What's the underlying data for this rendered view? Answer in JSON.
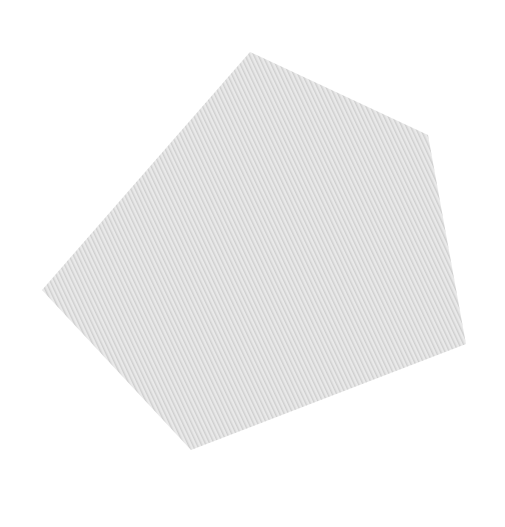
{
  "canvas": {
    "width": 505,
    "height": 527,
    "background": "#ffffff"
  },
  "shape": {
    "type": "pentagon",
    "fill": "#dddddd",
    "texture_light": "#e9e9e9",
    "texture_dark": "#cfcfcf",
    "points": [
      [
        250,
        52
      ],
      [
        428,
        135
      ],
      [
        466,
        344
      ],
      [
        191,
        450
      ],
      [
        42,
        290
      ]
    ]
  }
}
